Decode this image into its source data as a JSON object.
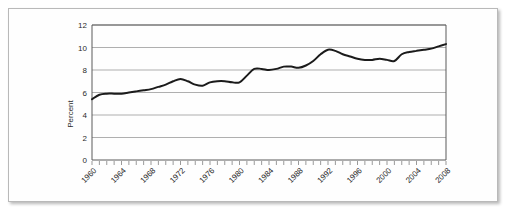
{
  "chart_data": {
    "type": "line",
    "title": "",
    "xlabel": "",
    "ylabel": "Percent",
    "xlim": [
      1960,
      2008
    ],
    "ylim": [
      0,
      12
    ],
    "ytick_labels": [
      "0",
      "2",
      "4",
      "6",
      "8",
      "10",
      "12"
    ],
    "ytick_values": [
      0,
      2,
      4,
      6,
      8,
      10,
      12
    ],
    "xtick_labels": [
      "1960",
      "1964",
      "1968",
      "1972",
      "1976",
      "1980",
      "1984",
      "1988",
      "1992",
      "1996",
      "2000",
      "2004",
      "2008"
    ],
    "xtick_values": [
      1960,
      1964,
      1968,
      1972,
      1976,
      1980,
      1984,
      1988,
      1992,
      1996,
      2000,
      2004,
      2008
    ],
    "minor_xticks_every": 1,
    "grid": "horizontal",
    "legend": "none",
    "series": [
      {
        "name": "Percent",
        "color": "#1b1b1b",
        "x": [
          1960,
          1961,
          1962,
          1963,
          1964,
          1965,
          1966,
          1967,
          1968,
          1969,
          1970,
          1971,
          1972,
          1973,
          1974,
          1975,
          1976,
          1977,
          1978,
          1979,
          1980,
          1981,
          1982,
          1983,
          1984,
          1985,
          1986,
          1987,
          1988,
          1989,
          1990,
          1991,
          1992,
          1993,
          1994,
          1995,
          1996,
          1997,
          1998,
          1999,
          2000,
          2001,
          2002,
          2003,
          2004,
          2005,
          2006,
          2007,
          2008
        ],
        "values": [
          5.4,
          5.8,
          5.9,
          5.9,
          5.9,
          6.0,
          6.1,
          6.2,
          6.3,
          6.5,
          6.7,
          7.0,
          7.2,
          7.0,
          6.7,
          6.6,
          6.9,
          7.0,
          7.0,
          6.9,
          6.9,
          7.5,
          8.1,
          8.1,
          8.0,
          8.1,
          8.3,
          8.3,
          8.2,
          8.4,
          8.8,
          9.4,
          9.8,
          9.7,
          9.4,
          9.2,
          9.0,
          8.9,
          8.9,
          9.0,
          8.9,
          8.8,
          9.4,
          9.6,
          9.7,
          9.8,
          9.9,
          10.1,
          10.3
        ]
      }
    ]
  }
}
